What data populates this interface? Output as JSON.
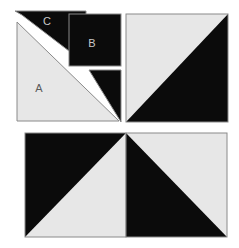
{
  "figure": {
    "canvas": {
      "width": 239,
      "height": 248
    },
    "colors": {
      "background": "#ffffff",
      "dark_fill": "#0b0b0b",
      "light_fill": "#e7e7e7",
      "outline": "#8a8a8a",
      "label_on_dark": "#c9c9c9",
      "label_on_light": "#5a5a5a"
    },
    "labels": [
      {
        "id": "label-c",
        "text": "C",
        "x": 47,
        "y": 21,
        "on": "dark"
      },
      {
        "id": "label-b",
        "text": "B",
        "x": 92,
        "y": 43,
        "on": "dark"
      },
      {
        "id": "label-a",
        "text": "A",
        "x": 39,
        "y": 88,
        "on": "light"
      }
    ],
    "groups": [
      {
        "id": "top-left-group",
        "name": "dissected-square-top-left",
        "bounds": {
          "x": 14,
          "y": 10,
          "width": 107,
          "height": 112
        },
        "pieces": [
          {
            "id": "piece-c",
            "name": "triangle-c",
            "label": "C",
            "fill": "dark"
          },
          {
            "id": "piece-b",
            "name": "square-b",
            "label": "B",
            "fill": "dark"
          },
          {
            "id": "piece-d",
            "name": "triangle-d",
            "label": "",
            "fill": "dark"
          },
          {
            "id": "piece-a",
            "name": "triangle-a",
            "label": "A",
            "fill": "light"
          }
        ]
      },
      {
        "id": "top-right-square",
        "name": "half-square-top-right",
        "bounds": {
          "x": 126,
          "y": 14,
          "width": 102,
          "height": 108
        },
        "pieces": [
          {
            "id": "tr-light",
            "name": "triangle-upper-left-light",
            "fill": "light"
          },
          {
            "id": "tr-dark",
            "name": "triangle-lower-right-dark",
            "fill": "dark"
          }
        ]
      },
      {
        "id": "bottom-left-square",
        "name": "half-square-bottom-left",
        "bounds": {
          "x": 25,
          "y": 133,
          "width": 101,
          "height": 104
        },
        "pieces": [
          {
            "id": "bl-dark",
            "name": "triangle-upper-left-dark",
            "fill": "dark"
          },
          {
            "id": "bl-light",
            "name": "triangle-lower-right-light",
            "fill": "light"
          }
        ]
      },
      {
        "id": "bottom-right-square",
        "name": "half-square-bottom-right",
        "bounds": {
          "x": 126,
          "y": 133,
          "width": 101,
          "height": 104
        },
        "pieces": [
          {
            "id": "br-light",
            "name": "triangle-upper-right-light",
            "fill": "light"
          },
          {
            "id": "br-dark",
            "name": "triangle-lower-left-dark",
            "fill": "dark"
          }
        ]
      }
    ]
  }
}
